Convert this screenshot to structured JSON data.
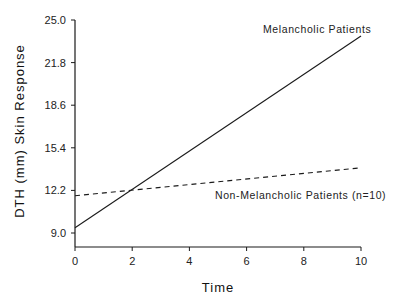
{
  "chart_data": {
    "type": "line",
    "title": "",
    "xlabel": "Time",
    "ylabel": "DTH (mm) Skin Response",
    "xlim": [
      0,
      10
    ],
    "ylim": [
      8.0,
      25.0
    ],
    "x_ticks": [
      0,
      2,
      4,
      6,
      8,
      10
    ],
    "x_tick_labels": [
      "0",
      "2",
      "4",
      "6",
      "8",
      "10"
    ],
    "y_ticks": [
      9.0,
      12.2,
      15.4,
      18.6,
      21.8,
      25.0
    ],
    "y_tick_labels": [
      "9.0",
      "12.2",
      "15.4",
      "18.6",
      "21.8",
      "25.0"
    ],
    "grid": false,
    "legend": "none (inline annotations)",
    "series": [
      {
        "name": "Melancholic Patients",
        "style": "solid",
        "x": [
          0,
          10
        ],
        "values": [
          9.4,
          23.8
        ]
      },
      {
        "name": "Non-Melancholic Patients (n=10)",
        "style": "dashed",
        "x": [
          0,
          10
        ],
        "values": [
          11.8,
          13.9
        ]
      }
    ],
    "annotations": [
      {
        "text": "Melancholic Patients",
        "series": "Melancholic Patients"
      },
      {
        "text": "Non-Melancholic Patients (n=10)",
        "series": "Non-Melancholic Patients (n=10)"
      }
    ]
  },
  "colors": {
    "line": "#1a1a1a",
    "axis": "#1a1a1a",
    "background": "#ffffff"
  }
}
